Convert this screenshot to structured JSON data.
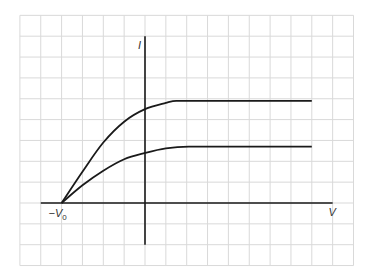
{
  "chart_data": {
    "type": "line",
    "title": "",
    "xlabel": "V",
    "ylabel": "I",
    "annotations": [
      {
        "text": "−V0",
        "x": -4,
        "y": 0,
        "meaning": "stopping potential −V₀ where both curves start"
      }
    ],
    "grid": true,
    "grid_cell_units": 1,
    "xlim": [
      -6,
      10
    ],
    "ylim": [
      -3,
      9
    ],
    "legend": null,
    "series": [
      {
        "name": "upper curve (higher intensity)",
        "points": [
          [
            -4,
            0
          ],
          [
            -3,
            1.5
          ],
          [
            -2,
            2.9
          ],
          [
            -1,
            3.9
          ],
          [
            0,
            4.5
          ],
          [
            1,
            4.8
          ],
          [
            1.5,
            4.9
          ],
          [
            8,
            4.9
          ]
        ]
      },
      {
        "name": "lower curve (lower intensity)",
        "points": [
          [
            -4,
            0
          ],
          [
            -3,
            0.85
          ],
          [
            -2,
            1.55
          ],
          [
            -1,
            2.1
          ],
          [
            0,
            2.4
          ],
          [
            1,
            2.62
          ],
          [
            2.1,
            2.7
          ],
          [
            8,
            2.7
          ]
        ]
      }
    ],
    "axes": {
      "v_axis_range": [
        -5,
        9
      ],
      "i_axis_range": [
        -2,
        8
      ]
    }
  },
  "labels": {
    "y_axis": "I",
    "x_axis": "V",
    "neg_v0_main": "−V",
    "neg_v0_sub": "0"
  },
  "colors": {
    "grid": "#d9d9d9",
    "ink": "#1a1a1a",
    "label": "#333333"
  }
}
